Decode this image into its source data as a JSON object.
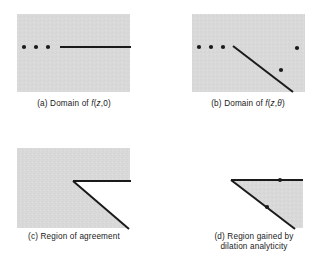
{
  "figure": {
    "background_color": "#ffffff",
    "region_fill": "#d8d8d8",
    "ink_color": "#1a1a1a",
    "width": 331,
    "height": 268
  },
  "panels": [
    {
      "id": "a",
      "tag": "(a)",
      "caption_text": "(a) Domain of f(z, 0)",
      "caption_parts": {
        "label": "(a)",
        "word_domain": "Domain",
        "word_of": "of",
        "function_name": "f",
        "arg_open": "(",
        "arg_z": "z",
        "arg_comma": ",",
        "arg_second": "0",
        "arg_close": ")"
      },
      "region_shape": "rectangle",
      "rect": {
        "x": 17,
        "y": 14,
        "w": 113,
        "h": 78
      },
      "dots": [
        {
          "x": 24,
          "y": 47,
          "r": 2.1
        },
        {
          "x": 36,
          "y": 47,
          "r": 2.1
        },
        {
          "x": 48,
          "y": 47,
          "r": 2.1
        }
      ],
      "cut_lines": [
        {
          "x1": 60,
          "y1": 47,
          "x2": 131,
          "y2": 47,
          "width": 2.0
        }
      ]
    },
    {
      "id": "b",
      "tag": "(b)",
      "caption_text": "(b) Domain of f(z, θ)",
      "caption_parts": {
        "label": "(b)",
        "word_domain": "Domain",
        "word_of": "of",
        "function_name": "f",
        "arg_open": "(",
        "arg_z": "z",
        "arg_comma": ",",
        "arg_second": "θ",
        "arg_close": ")"
      },
      "region_shape": "rectangle",
      "rect": {
        "x": 192,
        "y": 14,
        "w": 113,
        "h": 78
      },
      "dots": [
        {
          "x": 199,
          "y": 47,
          "r": 2.1
        },
        {
          "x": 211,
          "y": 47,
          "r": 2.1
        },
        {
          "x": 223,
          "y": 47,
          "r": 2.1
        },
        {
          "x": 297,
          "y": 48,
          "r": 2.1
        },
        {
          "x": 281,
          "y": 70,
          "r": 2.1
        }
      ],
      "cut_lines": [
        {
          "x1": 233,
          "y1": 46,
          "x2": 293,
          "y2": 92,
          "width": 2.0
        }
      ]
    },
    {
      "id": "c",
      "tag": "(c)",
      "caption_text": "(c) Region of agreement",
      "caption_parts": {
        "label": "(c)",
        "word_region": "Region",
        "word_of": "of",
        "word_agreement": "agreement"
      },
      "region_shape": "notched",
      "rect": {
        "x": 17,
        "y": 148,
        "w": 113,
        "h": 80
      },
      "polygon_points": "17,148 130,148 130,181 73,181 128,228 17,228",
      "vertex": {
        "x": 73,
        "y": 181
      },
      "dots": [],
      "cut_lines": [
        {
          "x1": 73,
          "y1": 181,
          "x2": 131,
          "y2": 181,
          "width": 2.0
        },
        {
          "x1": 73,
          "y1": 181,
          "x2": 129,
          "y2": 229,
          "width": 2.0
        }
      ]
    },
    {
      "id": "d",
      "tag": "(d)",
      "caption_text": "(d) Region gained by dilation analyticity",
      "caption_parts": {
        "label": "(d)",
        "line1": "(d) Region gained by",
        "line2": "dilation analyticity"
      },
      "region_shape": "triangle",
      "rect": {
        "x": 231,
        "y": 180,
        "w": 71,
        "h": 48
      },
      "polygon_points": "231,180 303,180 303,228 294,228",
      "vertex": {
        "x": 231,
        "y": 180
      },
      "dots": [
        {
          "x": 280,
          "y": 180,
          "r": 2.0
        },
        {
          "x": 267,
          "y": 207,
          "r": 2.1
        }
      ],
      "cut_lines": [
        {
          "x1": 231,
          "y1": 180,
          "x2": 303,
          "y2": 180,
          "width": 2.0
        },
        {
          "x1": 231,
          "y1": 180,
          "x2": 295,
          "y2": 229,
          "width": 2.0
        }
      ]
    }
  ],
  "captions": {
    "a": {
      "x": 17,
      "y": 99,
      "w": 114,
      "lines": [
        "(a) Domain of f(z, 0)"
      ]
    },
    "b": {
      "x": 191,
      "y": 99,
      "w": 114,
      "lines": [
        "(b) Domain of f(z, θ)"
      ]
    },
    "c": {
      "x": 13,
      "y": 232,
      "w": 122,
      "lines": [
        "(c) Region of agreement"
      ]
    },
    "d": {
      "x": 190,
      "y": 232,
      "w": 128,
      "lines": [
        "(d) Region gained by",
        "dilation analyticity"
      ]
    }
  }
}
